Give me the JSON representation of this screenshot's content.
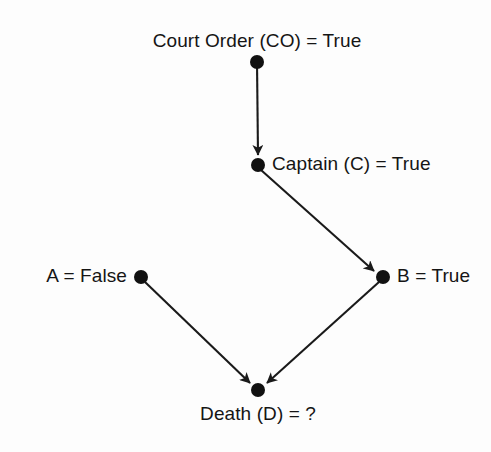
{
  "diagram": {
    "type": "directed-acyclic-graph",
    "background_color": "#fdfdfd",
    "node_color": "#111111",
    "edge_color": "#1a1a1a",
    "text_color": "#151515",
    "nodes": [
      {
        "id": "CO",
        "label": "Court Order (CO) = True",
        "x": 257,
        "y": 62,
        "label_x": 257,
        "label_y": 30,
        "label_anchor": "center",
        "value": "True"
      },
      {
        "id": "C",
        "label": "Captain (C) = True",
        "x": 258,
        "y": 165,
        "label_x": 272,
        "label_y": 153,
        "label_anchor": "left",
        "value": "True"
      },
      {
        "id": "A",
        "label": "A = False",
        "x": 141,
        "y": 277,
        "label_x": 127,
        "label_y": 265,
        "label_anchor": "right",
        "value": "False"
      },
      {
        "id": "B",
        "label": "B = True",
        "x": 383,
        "y": 277,
        "label_x": 397,
        "label_y": 265,
        "label_anchor": "left",
        "value": "True"
      },
      {
        "id": "D",
        "label": "Death (D) = ?",
        "x": 258,
        "y": 390,
        "label_x": 258,
        "label_y": 403,
        "label_anchor": "center",
        "value": "?"
      }
    ],
    "edges": [
      {
        "from": "CO",
        "to": "C",
        "arrow": true
      },
      {
        "from": "C",
        "to": "B",
        "arrow": true
      },
      {
        "from": "A",
        "to": "D",
        "arrow": true
      },
      {
        "from": "B",
        "to": "D",
        "arrow": true
      }
    ]
  }
}
